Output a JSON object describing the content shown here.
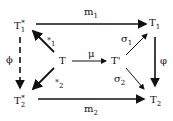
{
  "nodes": {
    "T1star": {
      "base": "T",
      "sub": "1",
      "sup": "*"
    },
    "T1": {
      "base": "T",
      "sub": "1"
    },
    "T": {
      "base": "T"
    },
    "Tprime": {
      "base": "T'"
    },
    "T2star": {
      "base": "T",
      "sub": "2",
      "sup": "*"
    },
    "T2": {
      "base": "T",
      "sub": "2"
    }
  },
  "edges": {
    "m1": {
      "base": "m",
      "sub": "1"
    },
    "m2": {
      "base": "m",
      "sub": "2"
    },
    "mu": {
      "base": "μ"
    },
    "sigma1": {
      "base": "σ",
      "sub": "1"
    },
    "sigma2": {
      "base": "σ",
      "sub": "2"
    },
    "e1": {
      "base": "*",
      "sub": "1"
    },
    "e2": {
      "base": "*",
      "sub": "2"
    },
    "phi_left": {
      "base": "ϕ"
    },
    "phi_right": {
      "base": "φ"
    }
  }
}
